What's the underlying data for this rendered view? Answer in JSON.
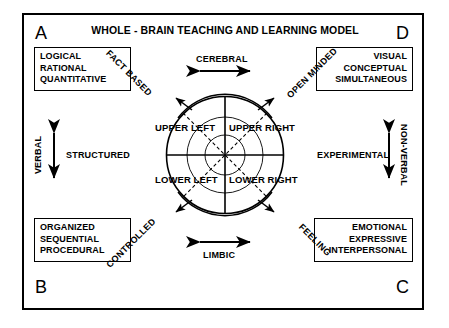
{
  "diagram": {
    "title": "WHOLE - BRAIN TEACHING AND LEARNING MODEL",
    "corners": {
      "a": "A",
      "b": "B",
      "c": "C",
      "d": "D"
    },
    "quadrant_boxes": [
      {
        "corner": "A",
        "position": "top-left",
        "lines": [
          "LOGICAL",
          "RATIONAL",
          "QUANTITATIVE"
        ]
      },
      {
        "corner": "D",
        "position": "top-right",
        "lines": [
          "VISUAL",
          "CONCEPTUAL",
          "SIMULTANEOUS"
        ]
      },
      {
        "corner": "B",
        "position": "bottom-left",
        "lines": [
          "ORGANIZED",
          "SEQUENTIAL",
          "PROCEDURAL"
        ]
      },
      {
        "corner": "C",
        "position": "bottom-right",
        "lines": [
          "EMOTIONAL",
          "EXPRESSIVE",
          "INTERPERSONAL"
        ]
      }
    ],
    "axis_labels": {
      "top": "CEREBRAL",
      "bottom": "LIMBIC",
      "left_horizontal": "STRUCTURED",
      "right_horizontal": "EXPERIMENTAL",
      "left_vertical": "VERBAL",
      "right_vertical": "NON-VERBAL"
    },
    "diagonal_labels": {
      "upper_left": "FACT BASED",
      "upper_right": "OPEN MINDED",
      "lower_left": "CONTROLLED",
      "lower_right": "FEELING"
    },
    "circle_quadrants": {
      "upper_left": "UPPER LEFT",
      "upper_right": "UPPER RIGHT",
      "lower_left": "LOWER LEFT",
      "lower_right": "LOWER RIGHT"
    },
    "colors": {
      "stroke": "#000000",
      "background": "#ffffff"
    }
  }
}
